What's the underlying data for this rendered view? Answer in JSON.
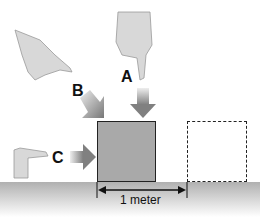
{
  "diagram": {
    "labels": {
      "a": "A",
      "b": "B",
      "c": "C"
    },
    "dimension_label": "1 meter",
    "colors": {
      "box_fill": "#a9a9a9",
      "arrow": "#8a8a8a",
      "ground": "#b0b0b0",
      "outline": "#222222"
    },
    "elements": [
      "hand-a-pointing-down",
      "hand-b-pointing-diagonal",
      "hand-c-pointing-right",
      "solid-box",
      "dashed-box-displaced",
      "ground"
    ]
  }
}
